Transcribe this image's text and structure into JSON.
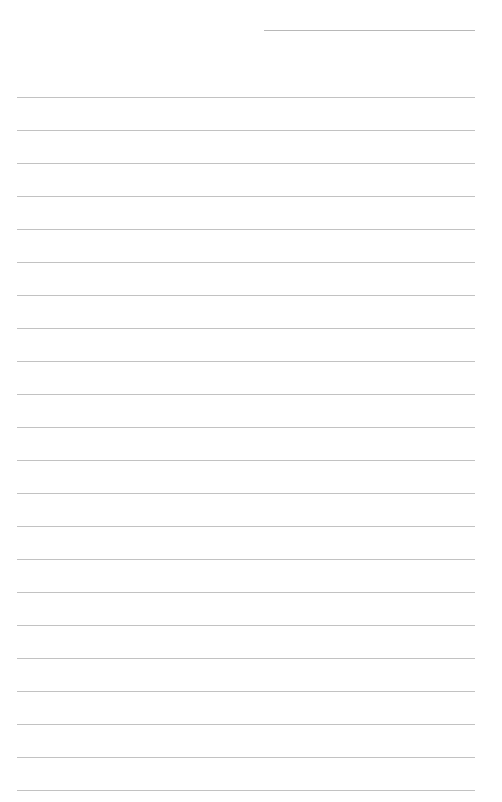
{
  "page": {
    "type": "lined-paper",
    "background": "#ffffff",
    "line_color": "#c2c2c2",
    "header_line": {
      "left": 264,
      "right": 475,
      "y": 30,
      "color": "#b8b8b8"
    },
    "rules": {
      "count": 22,
      "left": 17,
      "right": 475,
      "first_y": 97,
      "spacing": 33
    }
  }
}
